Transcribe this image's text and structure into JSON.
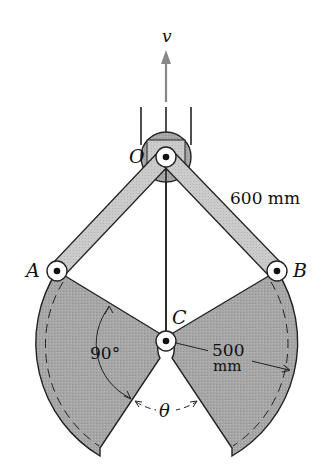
{
  "diagram": {
    "colors": {
      "fill": "#a8a8a8",
      "link": "#c8c8c8",
      "stroke": "#222222",
      "arrow": "#888888",
      "background": "#ffffff"
    },
    "labels": {
      "velocity": "v",
      "pivot_o": "O",
      "pivot_a": "A",
      "pivot_b": "B",
      "pivot_c": "C",
      "link_length": "600 mm",
      "radius_value": "500",
      "radius_unit": "mm",
      "angle_right": "90°",
      "angle_theta": "θ"
    },
    "points": {
      "O": [
        166,
        157
      ],
      "A": [
        57,
        271
      ],
      "B": [
        277,
        271
      ],
      "C": [
        166,
        341
      ]
    }
  }
}
